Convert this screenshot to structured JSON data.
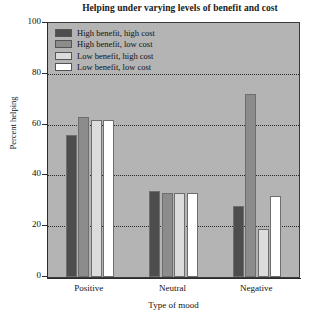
{
  "chart_data": {
    "type": "bar",
    "title": "Helping under varying levels of benefit and cost",
    "xlabel": "Type of mood",
    "ylabel": "Percent helping",
    "categories": [
      "Positive",
      "Neutral",
      "Negative"
    ],
    "series": [
      {
        "name": "High benefit, high cost",
        "color": "#4d4d4d",
        "values": [
          56,
          34,
          28
        ]
      },
      {
        "name": "High benefit, low cost",
        "color": "#8c8c8c",
        "values": [
          63,
          33,
          72
        ]
      },
      {
        "name": "Low benefit, high cost",
        "color": "#dcdcdc",
        "values": [
          62,
          33,
          19
        ]
      },
      {
        "name": "Low benefit, low cost",
        "color": "#ffffff",
        "values": [
          62,
          33,
          32
        ]
      }
    ],
    "ylim": [
      0,
      100
    ],
    "yticks": [
      0,
      20,
      40,
      60,
      80,
      100
    ],
    "ytick_labels": [
      "0",
      "20",
      "40",
      "60",
      "80",
      "100"
    ],
    "grid": true,
    "grid_axis": "y",
    "legend_position": "upper left",
    "plot_background": "#b4b4b4"
  },
  "legend": {
    "items": [
      {
        "label": "High benefit, high cost"
      },
      {
        "label": "High benefit, low cost"
      },
      {
        "label": "Low benefit, high cost"
      },
      {
        "label": "Low benefit, low cost"
      }
    ]
  }
}
